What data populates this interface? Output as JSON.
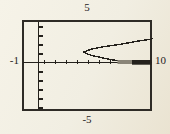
{
  "figure": {
    "top_label": "5",
    "bottom_label": "-5",
    "left_label": "-1",
    "right_label": "10"
  },
  "chart_data": {
    "type": "line",
    "title": "",
    "xlabel": "",
    "ylabel": "",
    "xlim": [
      -1,
      10
    ],
    "ylim": [
      -5,
      5
    ],
    "x_tick_step": 1,
    "y_tick_step": 1,
    "grid": false,
    "legend": "none",
    "frame_labels": {
      "top": "5",
      "bottom": "-5",
      "left": "-1",
      "right": "10"
    },
    "series": [
      {
        "name": "upper-branch",
        "points": [
          [
            4.0,
            1.17
          ],
          [
            4.7,
            1.5
          ],
          [
            5.6,
            1.72
          ],
          [
            6.5,
            1.89
          ],
          [
            7.4,
            2.06
          ],
          [
            8.3,
            2.28
          ],
          [
            9.1,
            2.44
          ],
          [
            10,
            2.61
          ]
        ]
      },
      {
        "name": "lower-branch",
        "points": [
          [
            4.0,
            1.17
          ],
          [
            4.3,
            0.94
          ],
          [
            4.7,
            0.78
          ],
          [
            5.3,
            0.61
          ],
          [
            5.9,
            0.44
          ],
          [
            6.5,
            0.3
          ],
          [
            7.0,
            0.19
          ]
        ]
      },
      {
        "name": "axis-overlap",
        "points": [
          [
            7.0,
            0.1
          ],
          [
            10,
            0.1
          ]
        ]
      }
    ]
  },
  "colors": {
    "paper": "#f1eee2",
    "ink": "#24211c",
    "box_border": "#2e2b26",
    "axis_overlap_gray": "#8a8578"
  }
}
